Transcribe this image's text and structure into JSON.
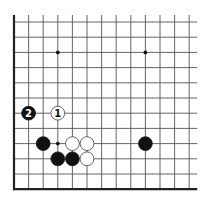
{
  "diagram": {
    "type": "go-board-fragment",
    "columns": 13,
    "rows": 12,
    "edges": {
      "left": true,
      "bottom": true,
      "top": false,
      "right": false
    },
    "colors": {
      "line": "#555555",
      "edge": "#222222",
      "black": "#111111",
      "white": "#ffffff",
      "white_outline": "#444444",
      "background": "#ffffff"
    },
    "star_points": [
      {
        "col": 3,
        "row": 2
      },
      {
        "col": 9,
        "row": 2
      },
      {
        "col": 3,
        "row": 8
      }
    ],
    "stones": [
      {
        "col": 1,
        "row": 6,
        "color": "black",
        "label": "2"
      },
      {
        "col": 3,
        "row": 6,
        "color": "white",
        "label": "1"
      },
      {
        "col": 2,
        "row": 8,
        "color": "black",
        "label": ""
      },
      {
        "col": 4,
        "row": 8,
        "color": "white",
        "label": ""
      },
      {
        "col": 5,
        "row": 8,
        "color": "white",
        "label": ""
      },
      {
        "col": 3,
        "row": 9,
        "color": "black",
        "label": ""
      },
      {
        "col": 4,
        "row": 9,
        "color": "black",
        "label": ""
      },
      {
        "col": 5,
        "row": 9,
        "color": "white",
        "label": ""
      },
      {
        "col": 9,
        "row": 8,
        "color": "black",
        "label": ""
      }
    ]
  }
}
